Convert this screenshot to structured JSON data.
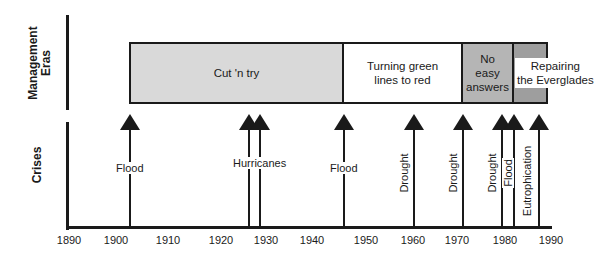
{
  "rows": {
    "management_label": "Management\nEras",
    "management_line1": "Management",
    "management_line2": "Eras",
    "crises_label": "Crises"
  },
  "eras": [
    {
      "label": "Cut 'n try",
      "start": 1903,
      "end": 1947,
      "color": "#d9d9d9"
    },
    {
      "label": "Turning green lines to red",
      "line1": "Turning green",
      "line2": "lines to red",
      "start": 1947,
      "end": 1972,
      "color": "#ffffff"
    },
    {
      "label": "No easy answers",
      "line1": "No",
      "line2": "easy",
      "line3": "answers",
      "start": 1972,
      "end": 1983,
      "color": "#b5b5b5"
    },
    {
      "label": "Repairing the Everglades",
      "line1": "Repairing",
      "line2": "the Everglades",
      "start": 1983,
      "end": 1990,
      "color": "#9e9e9e"
    }
  ],
  "crises": [
    {
      "label": "Flood",
      "year": 1903
    },
    {
      "label": "Hurricanes",
      "year": 1926
    },
    {
      "label": "",
      "year": 1928
    },
    {
      "label": "Flood",
      "year": 1947
    },
    {
      "label": "Drought",
      "year": 1960
    },
    {
      "label": "Drought",
      "year": 1972
    },
    {
      "label": "Drought",
      "year": 1980
    },
    {
      "label": "Flood",
      "year": 1983
    },
    {
      "label": "Eutrophication",
      "year": 1988
    }
  ],
  "axis": {
    "ticks": [
      "1890",
      "1900",
      "1910",
      "1920",
      "1930",
      "1940",
      "1950",
      "1960",
      "1970",
      "1980",
      "1990"
    ]
  }
}
